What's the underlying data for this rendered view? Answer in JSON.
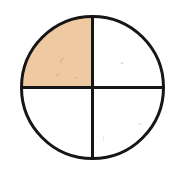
{
  "figure": {
    "type": "fraction-circle",
    "shaded_fraction": "1/4",
    "shaded_count": 1,
    "total_parts": 4,
    "colors": {
      "background": "#ffffff",
      "outline": "#161616",
      "shaded_fill": "#eec9a2",
      "unshaded_fill": "#ffffff",
      "speck_dark": "#c09a72",
      "speck_faint": "#c9c9c9"
    },
    "quadrants": [
      {
        "position": "top-left",
        "shaded": true,
        "fill": "#eec9a2"
      },
      {
        "position": "top-right",
        "shaded": false,
        "fill": "#ffffff"
      },
      {
        "position": "bottom-left",
        "shaded": false,
        "fill": "#ffffff"
      },
      {
        "position": "bottom-right",
        "shaded": false,
        "fill": "#ffffff"
      }
    ]
  }
}
